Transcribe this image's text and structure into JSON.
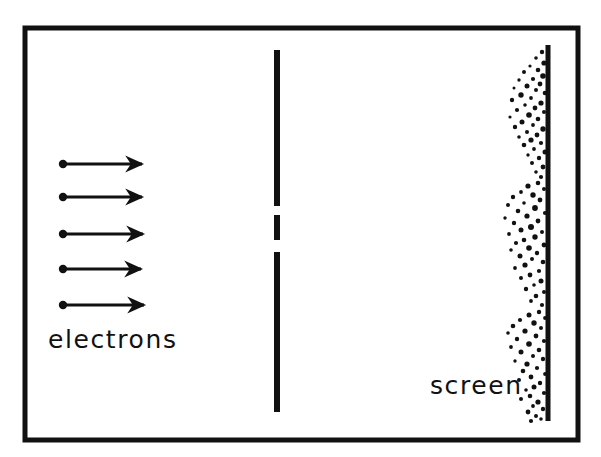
{
  "figure": {
    "background_color": "#ffffff",
    "ink_color": "#111111",
    "width": 601,
    "height": 457
  },
  "border": {
    "name": "outer-frame",
    "x": 25,
    "y": 28,
    "width": 553,
    "height": 412,
    "stroke_width": 5,
    "color": "#111111"
  },
  "labels": {
    "electrons": "electrons",
    "screen": "screen"
  },
  "label_positions": {
    "electrons": {
      "x": 48,
      "y": 348
    },
    "screen": {
      "x": 430,
      "y": 394
    }
  },
  "beam": {
    "name": "electron-beam",
    "arrow_count": 5,
    "arrows": [
      {
        "x1": 63,
        "y1": 164,
        "x2": 146,
        "y2": 164,
        "dot_r": 4.2
      },
      {
        "x1": 63,
        "y1": 197,
        "x2": 146,
        "y2": 197,
        "dot_r": 4.2
      },
      {
        "x1": 63,
        "y1": 234,
        "x2": 147,
        "y2": 234,
        "dot_r": 4.2
      },
      {
        "x1": 63,
        "y1": 269,
        "x2": 145,
        "y2": 269,
        "dot_r": 4.2
      },
      {
        "x1": 63,
        "y1": 305,
        "x2": 148,
        "y2": 305,
        "dot_r": 4.2
      }
    ],
    "line_width": 3,
    "color": "#111111"
  },
  "barrier": {
    "name": "double-slit-barrier",
    "x": 277,
    "stroke_width": 6,
    "color": "#111111",
    "segments": [
      {
        "y1": 50,
        "y2": 206
      },
      {
        "y1": 215,
        "y2": 240
      },
      {
        "y1": 252,
        "y2": 412
      }
    ],
    "slits": [
      {
        "y1": 206,
        "y2": 215
      },
      {
        "y1": 240,
        "y2": 252
      }
    ]
  },
  "screen": {
    "name": "detector-screen",
    "x": 548,
    "y1": 45,
    "y2": 421,
    "stroke_width": 5,
    "color": "#111111"
  },
  "speckle": {
    "name": "impact-speckle-pattern",
    "dot_color": "#111111",
    "dot_min_r": 1.3,
    "dot_max_r": 3.4,
    "band_centers": [
      82,
      130,
      180,
      232,
      285,
      330,
      382,
      412
    ],
    "points": [
      [
        542,
        52,
        2.2
      ],
      [
        536,
        58,
        1.8
      ],
      [
        544,
        63,
        2.6
      ],
      [
        530,
        66,
        1.6
      ],
      [
        538,
        70,
        2.3
      ],
      [
        524,
        72,
        2.0
      ],
      [
        543,
        76,
        2.8
      ],
      [
        533,
        79,
        2.1
      ],
      [
        519,
        80,
        1.7
      ],
      [
        540,
        84,
        2.4
      ],
      [
        527,
        86,
        2.5
      ],
      [
        514,
        88,
        1.5
      ],
      [
        536,
        90,
        2.0
      ],
      [
        545,
        93,
        2.3
      ],
      [
        521,
        95,
        2.7
      ],
      [
        531,
        98,
        1.9
      ],
      [
        512,
        100,
        2.2
      ],
      [
        541,
        103,
        2.6
      ],
      [
        525,
        105,
        1.8
      ],
      [
        535,
        108,
        2.4
      ],
      [
        517,
        110,
        2.1
      ],
      [
        544,
        112,
        2.0
      ],
      [
        529,
        115,
        2.8
      ],
      [
        510,
        117,
        1.6
      ],
      [
        538,
        119,
        2.3
      ],
      [
        522,
        122,
        2.5
      ],
      [
        533,
        125,
        1.9
      ],
      [
        515,
        127,
        2.2
      ],
      [
        543,
        129,
        2.7
      ],
      [
        527,
        132,
        2.0
      ],
      [
        537,
        135,
        2.4
      ],
      [
        519,
        137,
        1.8
      ],
      [
        531,
        140,
        2.6
      ],
      [
        541,
        143,
        2.1
      ],
      [
        524,
        145,
        2.3
      ],
      [
        534,
        149,
        1.9
      ],
      [
        545,
        152,
        2.5
      ],
      [
        528,
        155,
        1.7
      ],
      [
        539,
        158,
        2.2
      ],
      [
        532,
        163,
        2.0
      ],
      [
        543,
        167,
        2.4
      ],
      [
        536,
        172,
        1.8
      ],
      [
        541,
        177,
        2.1
      ],
      [
        538,
        183,
        2.3
      ],
      [
        528,
        186,
        2.6
      ],
      [
        544,
        189,
        2.0
      ],
      [
        521,
        192,
        1.9
      ],
      [
        533,
        195,
        2.7
      ],
      [
        513,
        197,
        2.2
      ],
      [
        540,
        200,
        2.4
      ],
      [
        524,
        203,
        1.8
      ],
      [
        508,
        205,
        2.0
      ],
      [
        535,
        208,
        2.9
      ],
      [
        518,
        211,
        2.3
      ],
      [
        545,
        213,
        2.1
      ],
      [
        527,
        216,
        2.6
      ],
      [
        505,
        218,
        1.7
      ],
      [
        538,
        221,
        2.4
      ],
      [
        514,
        223,
        2.2
      ],
      [
        531,
        227,
        3.0
      ],
      [
        521,
        230,
        2.5
      ],
      [
        542,
        232,
        2.0
      ],
      [
        509,
        234,
        1.9
      ],
      [
        535,
        237,
        2.7
      ],
      [
        524,
        240,
        2.3
      ],
      [
        516,
        243,
        2.1
      ],
      [
        544,
        245,
        2.4
      ],
      [
        529,
        248,
        2.8
      ],
      [
        511,
        250,
        1.8
      ],
      [
        537,
        253,
        2.2
      ],
      [
        520,
        256,
        2.5
      ],
      [
        532,
        259,
        2.0
      ],
      [
        543,
        262,
        2.3
      ],
      [
        525,
        265,
        2.6
      ],
      [
        515,
        268,
        1.9
      ],
      [
        539,
        271,
        2.1
      ],
      [
        530,
        275,
        2.4
      ],
      [
        521,
        278,
        2.0
      ],
      [
        541,
        281,
        2.5
      ],
      [
        534,
        285,
        1.8
      ],
      [
        526,
        289,
        2.2
      ],
      [
        544,
        292,
        2.0
      ],
      [
        536,
        296,
        2.3
      ],
      [
        531,
        301,
        1.9
      ],
      [
        542,
        305,
        2.1
      ],
      [
        539,
        312,
        2.2
      ],
      [
        529,
        315,
        2.5
      ],
      [
        545,
        318,
        1.9
      ],
      [
        520,
        320,
        2.1
      ],
      [
        534,
        323,
        2.7
      ],
      [
        513,
        326,
        2.3
      ],
      [
        541,
        328,
        2.0
      ],
      [
        525,
        331,
        2.6
      ],
      [
        508,
        333,
        1.8
      ],
      [
        536,
        336,
        2.4
      ],
      [
        517,
        339,
        2.2
      ],
      [
        544,
        341,
        2.1
      ],
      [
        529,
        344,
        2.8
      ],
      [
        511,
        347,
        1.9
      ],
      [
        539,
        350,
        2.3
      ],
      [
        521,
        352,
        2.5
      ],
      [
        533,
        356,
        2.0
      ],
      [
        543,
        359,
        2.2
      ],
      [
        515,
        361,
        1.7
      ],
      [
        527,
        364,
        2.6
      ],
      [
        537,
        368,
        2.1
      ],
      [
        523,
        371,
        2.3
      ],
      [
        545,
        374,
        1.9
      ],
      [
        531,
        377,
        2.4
      ],
      [
        519,
        380,
        2.0
      ],
      [
        540,
        383,
        2.2
      ],
      [
        534,
        387,
        2.5
      ],
      [
        526,
        390,
        1.8
      ],
      [
        544,
        393,
        2.1
      ],
      [
        530,
        396,
        2.3
      ],
      [
        521,
        399,
        2.0
      ],
      [
        538,
        402,
        2.6
      ],
      [
        533,
        406,
        1.9
      ],
      [
        543,
        409,
        2.2
      ],
      [
        528,
        412,
        2.4
      ],
      [
        536,
        416,
        2.0
      ],
      [
        541,
        419,
        1.8
      ],
      [
        531,
        421,
        2.1
      ]
    ]
  }
}
